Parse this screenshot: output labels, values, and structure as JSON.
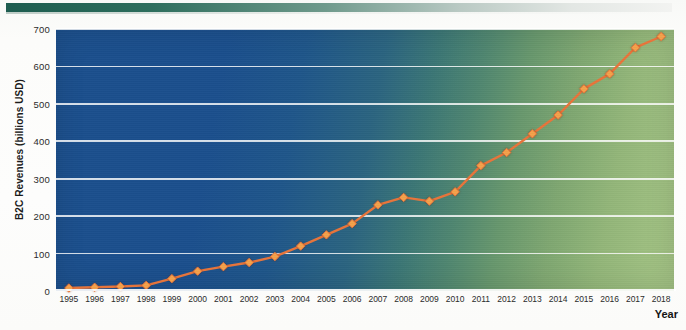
{
  "chart_data": {
    "type": "line",
    "title": "",
    "xlabel": "Year",
    "ylabel": "B2C Revenues (billions USD)",
    "ylim": [
      0,
      700
    ],
    "yticks": [
      0,
      100,
      200,
      300,
      400,
      500,
      600,
      700
    ],
    "grid": true,
    "legend": "none",
    "marker": "diamond",
    "line_color": "#e8743a",
    "marker_color": "#f4a14a",
    "categories": [
      "1995",
      "1996",
      "1997",
      "1998",
      "1999",
      "2000",
      "2001",
      "2002",
      "2003",
      "2004",
      "2005",
      "2006",
      "2007",
      "2008",
      "2009",
      "2010",
      "2011",
      "2012",
      "2013",
      "2014",
      "2015",
      "2016",
      "2017",
      "2018"
    ],
    "values": [
      8,
      10,
      12,
      15,
      33,
      53,
      65,
      76,
      92,
      120,
      150,
      180,
      230,
      250,
      240,
      265,
      335,
      370,
      420,
      470,
      540,
      580,
      650,
      680
    ],
    "axis_ranges": {
      "x": [
        "1995",
        "2018"
      ],
      "y": [
        0,
        700
      ]
    },
    "background_gradient": {
      "from": "#1b4f8d",
      "to": "#a3c384"
    },
    "annotations": []
  },
  "decor": {
    "top_rule_color_start": "#1d5c4f",
    "top_rule_color_end": "#f2f3f1"
  }
}
